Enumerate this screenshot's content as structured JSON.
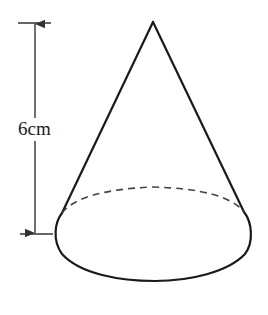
{
  "diagram": {
    "type": "cone",
    "height_label": "6cm",
    "colors": {
      "stroke": "#1a1a1a",
      "dimension": "#333333",
      "background": "#ffffff"
    },
    "geometry": {
      "apex": [
        153,
        22
      ],
      "base_center": [
        153,
        233
      ],
      "base_rx": 97,
      "base_ry": 47,
      "left_tangent": [
        62,
        213
      ],
      "right_tangent": [
        244,
        212
      ]
    },
    "dimension_line": {
      "x": 35,
      "top_y": 23,
      "bottom_y": 234,
      "top_tick": [
        18,
        51
      ],
      "bottom_tick": [
        20,
        53
      ]
    }
  }
}
